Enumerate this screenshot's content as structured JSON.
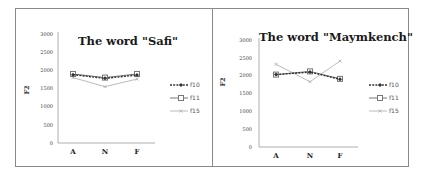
{
  "chart_data": [
    {
      "type": "line",
      "title": "The word \"Safi\"",
      "xlabel": "",
      "ylabel": "F2",
      "categories": [
        "A",
        "N",
        "F"
      ],
      "ylim": [
        0,
        3000
      ],
      "yticks": [
        "0",
        "500",
        "1000",
        "1500",
        "2000",
        "2500",
        "3000"
      ],
      "grid": false,
      "legend_position": "right",
      "series": [
        {
          "name": "f10",
          "values": [
            1880,
            1780,
            1870
          ],
          "style": "dashed",
          "color": "#333333",
          "marker": "diamond"
        },
        {
          "name": "f11",
          "values": [
            1900,
            1800,
            1900
          ],
          "style": "solid",
          "color": "#777777",
          "marker": "square"
        },
        {
          "name": "f15",
          "values": [
            1800,
            1550,
            1760
          ],
          "style": "solid",
          "color": "#bbbbbb",
          "marker": "x"
        }
      ]
    },
    {
      "type": "line",
      "title": "The word \"Maymkench\"",
      "xlabel": "",
      "ylabel": "F2",
      "categories": [
        "A",
        "N",
        "F"
      ],
      "ylim": [
        0,
        3000
      ],
      "yticks": [
        "0",
        "500",
        "1000",
        "1500",
        "2000",
        "2500",
        "3000"
      ],
      "grid": false,
      "legend_position": "right",
      "series": [
        {
          "name": "f10",
          "values": [
            2030,
            2100,
            1900
          ],
          "style": "dashed",
          "color": "#333333",
          "marker": "diamond"
        },
        {
          "name": "f11",
          "values": [
            2030,
            2120,
            1910
          ],
          "style": "solid",
          "color": "#777777",
          "marker": "square"
        },
        {
          "name": "f15",
          "values": [
            2320,
            1830,
            2410
          ],
          "style": "solid",
          "color": "#bbbbbb",
          "marker": "x"
        }
      ]
    }
  ]
}
